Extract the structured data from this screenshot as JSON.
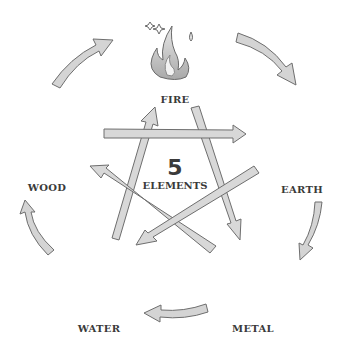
{
  "title": {
    "number": "5",
    "text": "ELEMENTS"
  },
  "elements": [
    {
      "name": "FIRE",
      "icon": "flame-icon"
    },
    {
      "name": "EARTH",
      "icon": "rocks-icon"
    },
    {
      "name": "METAL",
      "icon": "gear-icon"
    },
    {
      "name": "WATER",
      "icon": "water-drop-icon"
    },
    {
      "name": "WOOD",
      "icon": "tree-icon"
    }
  ],
  "generating_cycle": [
    {
      "from": "WOOD",
      "to": "FIRE"
    },
    {
      "from": "FIRE",
      "to": "EARTH"
    },
    {
      "from": "EARTH",
      "to": "METAL"
    },
    {
      "from": "METAL",
      "to": "WATER"
    },
    {
      "from": "WATER",
      "to": "WOOD"
    }
  ],
  "overcoming_cycle": [
    {
      "from": "WOOD",
      "to": "EARTH"
    },
    {
      "from": "EARTH",
      "to": "WATER"
    },
    {
      "from": "WATER",
      "to": "FIRE"
    },
    {
      "from": "FIRE",
      "to": "METAL"
    },
    {
      "from": "METAL",
      "to": "WOOD"
    }
  ],
  "colors": {
    "arrow_fill": "#d4d4d4",
    "arrow_stroke": "#6e6e6e",
    "text": "#3a3a3a",
    "icon_light": "#e6e6e6",
    "icon_mid": "#bdbdbd",
    "icon_dark": "#7a7a7a"
  }
}
